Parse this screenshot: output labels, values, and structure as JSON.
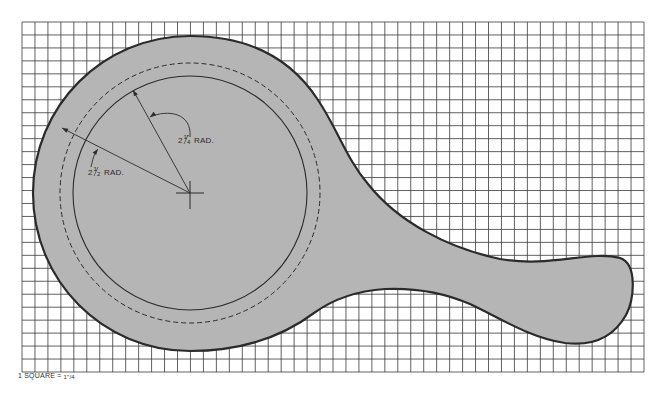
{
  "diagram": {
    "type": "pattern-drawing",
    "colors": {
      "background": "#ffffff",
      "grid_line": "#3a3a3a",
      "shape_fill": "#b5b5b5",
      "shape_outline": "#2b2b2b",
      "circle_line": "#2b2b2b"
    },
    "grid": {
      "x": 22,
      "y": 22,
      "width": 622,
      "height": 350,
      "columns": 48,
      "rows": 27
    },
    "center": {
      "x": 190,
      "y": 193
    },
    "outer_radius": 157,
    "dashed_circle_radius": 130,
    "solid_circle_radius": 117,
    "dimensions": [
      {
        "id": "inner",
        "whole": "2",
        "fraction": "1/4",
        "fraction_num": "1",
        "fraction_den": "4",
        "unit_mark": "\"",
        "suffix": "RAD.",
        "line_to": {
          "x": 133,
          "y": 90
        },
        "label_pos": {
          "x": 178,
          "y": 143
        }
      },
      {
        "id": "outer",
        "whole": "2",
        "fraction": "1/2",
        "fraction_num": "1",
        "fraction_den": "2",
        "unit_mark": "\"",
        "suffix": "RAD.",
        "line_to": {
          "x": 62,
          "y": 128
        },
        "label_pos": {
          "x": 88,
          "y": 175
        }
      }
    ],
    "scale_note": {
      "prefix": "1 SQUARE = ",
      "value_num": "1\"",
      "value_den": "4",
      "full_text": "1 SQUARE = 1\"/4"
    }
  }
}
